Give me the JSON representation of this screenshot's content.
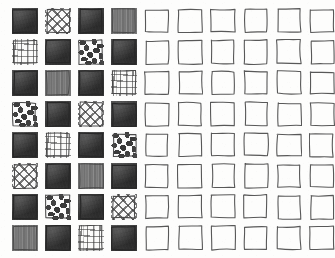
{
  "figure": {
    "kind": "hand-drawn-texture-swatch-grid",
    "rows": 8,
    "columns": 10,
    "filled_columns": 4,
    "empty_columns": 6,
    "total_cells": 80,
    "background_color": "#fdfdfc",
    "ink_color": "#3a3a3a",
    "outline_color": "#4a4a4a"
  },
  "legend": {
    "swatch_kinds": [
      {
        "id": "solid",
        "name": "solid-dark-fill",
        "color": "#3a3a3a"
      },
      {
        "id": "plaid",
        "name": "plaid-grid-hatch",
        "color": "#3c3c3c"
      },
      {
        "id": "maze",
        "name": "maze-labyrinth",
        "color": "#373737"
      },
      {
        "id": "blobs",
        "name": "irregular-blobs",
        "color": "#3c3c3c"
      },
      {
        "id": "dashes",
        "name": "dash-brick-strokes",
        "color": "#3a3a3a"
      },
      {
        "id": "empty",
        "name": "empty-outline",
        "color": "#ffffff"
      }
    ]
  },
  "grid": {
    "cells": [
      [
        "solid",
        "maze",
        "solid",
        "dashes",
        "empty",
        "empty",
        "empty",
        "empty",
        "empty",
        "empty"
      ],
      [
        "plaid",
        "solid",
        "blobs",
        "solid",
        "empty",
        "empty",
        "empty",
        "empty",
        "empty",
        "empty"
      ],
      [
        "solid",
        "dashes",
        "solid",
        "plaid",
        "empty",
        "empty",
        "empty",
        "empty",
        "empty",
        "empty"
      ],
      [
        "blobs",
        "solid",
        "maze",
        "solid",
        "empty",
        "empty",
        "empty",
        "empty",
        "empty",
        "empty"
      ],
      [
        "solid",
        "plaid",
        "solid",
        "blobs",
        "empty",
        "empty",
        "empty",
        "empty",
        "empty",
        "empty"
      ],
      [
        "maze",
        "solid",
        "dashes",
        "solid",
        "empty",
        "empty",
        "empty",
        "empty",
        "empty",
        "empty"
      ],
      [
        "solid",
        "blobs",
        "solid",
        "maze",
        "empty",
        "empty",
        "empty",
        "empty",
        "empty",
        "empty"
      ],
      [
        "dashes",
        "solid",
        "plaid",
        "solid",
        "empty",
        "empty",
        "empty",
        "empty",
        "empty",
        "empty"
      ]
    ]
  }
}
